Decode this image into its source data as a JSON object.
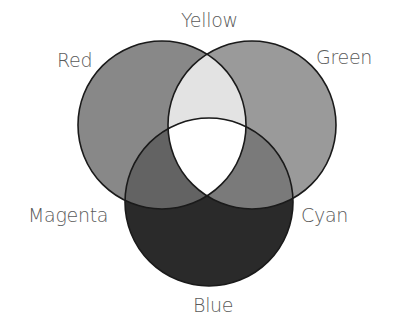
{
  "diagram": {
    "type": "venn",
    "title": "",
    "sets": [
      {
        "id": "red",
        "label": "Red",
        "cx": 162,
        "cy": 125,
        "r": 84,
        "fill": "#888888"
      },
      {
        "id": "green",
        "label": "Green",
        "cx": 252,
        "cy": 125,
        "r": 84,
        "fill": "#9a9a9a"
      },
      {
        "id": "blue",
        "label": "Blue",
        "cx": 209,
        "cy": 202,
        "r": 84,
        "fill": "#2a2a2a"
      }
    ],
    "intersections": [
      {
        "sets": [
          "red",
          "green"
        ],
        "label": "Yellow",
        "fill": "#e3e3e3"
      },
      {
        "sets": [
          "red",
          "blue"
        ],
        "label": "Magenta",
        "fill": "#636363"
      },
      {
        "sets": [
          "green",
          "blue"
        ],
        "label": "Cyan",
        "fill": "#7a7a7a"
      },
      {
        "sets": [
          "red",
          "green",
          "blue"
        ],
        "label": "",
        "fill": "#ffffff"
      }
    ],
    "stroke": "#1a1a1a"
  },
  "labels": {
    "yellow": "Yellow",
    "red": "Red",
    "green": "Green",
    "magenta": "Magenta",
    "cyan": "Cyan",
    "blue": "Blue"
  }
}
